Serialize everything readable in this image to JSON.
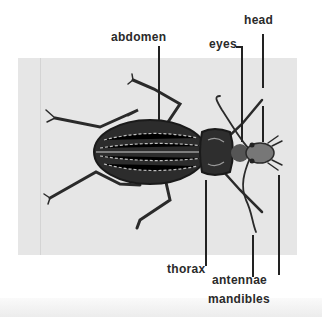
{
  "diagram": {
    "labels": {
      "abdomen": "abdomen",
      "eyes": "eyes",
      "head": "head",
      "thorax": "thorax",
      "antennae": "antennae",
      "mandibles": "mandibles"
    },
    "colors": {
      "panel": "#e6e6e6",
      "ink": "#222222",
      "background": "#ffffff"
    }
  }
}
